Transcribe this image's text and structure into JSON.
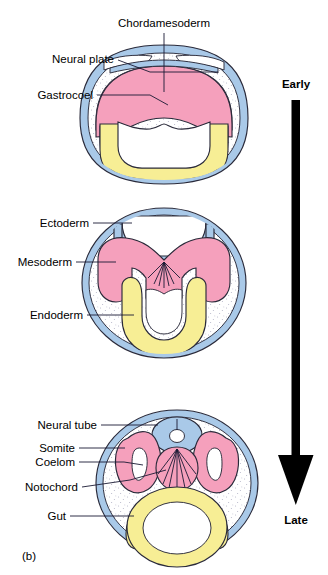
{
  "figure": {
    "panel_label": "(b)"
  },
  "timeline": {
    "early_label": "Early",
    "late_label": "Late",
    "arrow_direction": "down",
    "arrow_color": "#000000"
  },
  "colors": {
    "ectoderm_blue": "#a9c9e8",
    "mesoderm_pink": "#f5a0bc",
    "endoderm_yellow": "#f7ee95",
    "outline": "#2a2a3a",
    "stipple": "#7a7a9a",
    "cavity_white": "#ffffff",
    "background": "#ffffff"
  },
  "stages": [
    {
      "id": "early",
      "name": "neural-plate-stage",
      "labels": [
        {
          "id": "chordamesoderm",
          "text": "Chordamesoderm"
        },
        {
          "id": "neural-plate",
          "text": "Neural plate"
        },
        {
          "id": "gastrocoel",
          "text": "Gastrocoel"
        }
      ]
    },
    {
      "id": "middle",
      "name": "neural-groove-stage",
      "labels": [
        {
          "id": "ectoderm",
          "text": "Ectoderm"
        },
        {
          "id": "mesoderm",
          "text": "Mesoderm"
        },
        {
          "id": "endoderm",
          "text": "Endoderm"
        }
      ]
    },
    {
      "id": "late",
      "name": "neural-tube-stage",
      "labels": [
        {
          "id": "neural-tube",
          "text": "Neural tube"
        },
        {
          "id": "somite",
          "text": "Somite"
        },
        {
          "id": "coelom",
          "text": "Coelom"
        },
        {
          "id": "notochord",
          "text": "Notochord"
        },
        {
          "id": "gut",
          "text": "Gut"
        }
      ]
    }
  ]
}
